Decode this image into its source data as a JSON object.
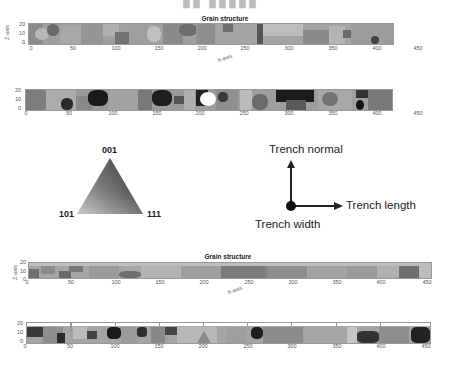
{
  "figure": {
    "top_title_partial": "ч р о ш ш ш",
    "panels": [
      {
        "id": "panel-1",
        "title": "Grain structure",
        "ylabel": "Z-axis",
        "xlabel": "X-axis",
        "yticks": [
          "20",
          "10",
          "0"
        ],
        "xticks": [
          "0",
          "50",
          "100",
          "150",
          "200",
          "250",
          "300",
          "350",
          "400",
          "450"
        ]
      },
      {
        "id": "panel-2",
        "title": "",
        "ylabel": "",
        "xlabel": "",
        "yticks": [
          "20",
          "10",
          "0"
        ],
        "xticks": [
          "0",
          "50",
          "100",
          "150",
          "200",
          "250",
          "300",
          "350",
          "400",
          "450"
        ]
      },
      {
        "id": "panel-3",
        "title": "Grain structure",
        "ylabel": "Z-axis",
        "xlabel": "X-axis",
        "yticks": [
          "20",
          "10",
          "0"
        ],
        "xticks": [
          "0",
          "50",
          "100",
          "150",
          "200",
          "250",
          "300",
          "350",
          "400",
          "450"
        ]
      },
      {
        "id": "panel-4",
        "title": "",
        "ylabel": "",
        "xlabel": "",
        "yticks": [
          "20",
          "10",
          "0"
        ],
        "xticks": [
          "0",
          "50",
          "100",
          "150",
          "200",
          "250",
          "300",
          "350",
          "400",
          "450"
        ]
      }
    ],
    "ipf_legend": {
      "top": "001",
      "left": "101",
      "right": "111"
    },
    "axes_diagram": {
      "up": "Trench normal",
      "right": "Trench length",
      "out": "Trench width"
    },
    "colors": {
      "axis_text": "#555555",
      "title_text": "#222222",
      "map_frame": "#999999"
    }
  }
}
